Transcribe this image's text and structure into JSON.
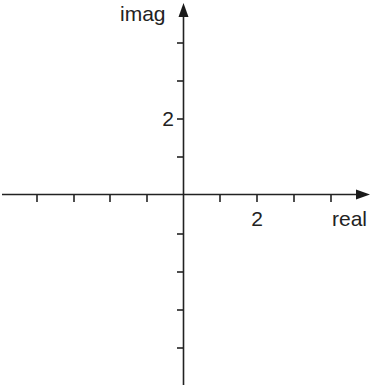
{
  "diagram": {
    "axes": {
      "real": {
        "label": "real",
        "tick_label": "2",
        "tick_label_value": 2,
        "ticks_each_side": 4,
        "tick_spacing_units": 1
      },
      "imag": {
        "label": "imag",
        "tick_label": "2",
        "tick_label_value": 2,
        "ticks_each_side": 4,
        "tick_spacing_units": 1
      }
    },
    "colors": {
      "axis": "#222222",
      "background": "#ffffff"
    }
  }
}
